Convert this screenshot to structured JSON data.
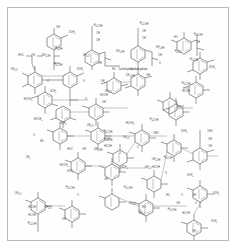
{
  "figure": {
    "kind": "chemical-structure-diagram",
    "frame_color": "#b9b9b9",
    "bond_color": "#4a4a4a",
    "background_color": "#fefefe",
    "text_color": "#3c3c3c"
  },
  "annotations": {
    "carbohydrate_label": "Carbohydrate"
  },
  "groups": {
    "methoxy": "OCH3",
    "hydroxyl": "OH",
    "hydroxymethyl": "CH2OH",
    "hydroxymethyl_left": "HOCH2",
    "hydroxymethyl_alt": "H2COH",
    "carbonyl": "HC=O",
    "aldehyde": "CHO",
    "carbinol": "HCOH",
    "methine": "CH",
    "methoxy_left": "H3CO",
    "ether_o": "O",
    "carbon": "C",
    "hydrogen_carbon": "HC"
  },
  "ring_count": 25,
  "labels": [
    {
      "id": 1,
      "text": "OH",
      "x": 50,
      "y": 20
    },
    {
      "id": 2,
      "text": "OCH3",
      "x": 64,
      "y": 25
    },
    {
      "id": 3,
      "text": "CH2OH",
      "x": 50,
      "y": 41
    },
    {
      "id": 4,
      "text": "HOC",
      "x": 13,
      "y": 48
    },
    {
      "id": 5,
      "text": "CH",
      "x": 25,
      "y": 48
    },
    {
      "id": 6,
      "text": "CH2OH",
      "x": 38,
      "y": 48
    },
    {
      "id": 7,
      "text": "H2COH",
      "x": 50,
      "y": 57
    },
    {
      "id": 8,
      "text": "CH3O",
      "x": 6,
      "y": 62
    },
    {
      "id": 9,
      "text": "OCH3",
      "x": 72,
      "y": 62
    },
    {
      "id": 10,
      "text": "O",
      "x": 40,
      "y": 74
    },
    {
      "id": 11,
      "text": "O",
      "x": 76,
      "y": 74
    },
    {
      "id": 12,
      "text": "CH2",
      "x": 95,
      "y": 74
    },
    {
      "id": 13,
      "text": "OCH3",
      "x": 45,
      "y": 84
    },
    {
      "id": 14,
      "text": "HOCH2",
      "x": 20,
      "y": 92
    },
    {
      "id": 15,
      "text": "HCOH",
      "x": 96,
      "y": 88
    },
    {
      "id": 16,
      "text": "O",
      "x": 78,
      "y": 92
    },
    {
      "id": 17,
      "text": "OH",
      "x": 96,
      "y": 95
    },
    {
      "id": 18,
      "text": "H2COH",
      "x": 90,
      "y": 18
    },
    {
      "id": 19,
      "text": "CH",
      "x": 90,
      "y": 26
    },
    {
      "id": 20,
      "text": "CH",
      "x": 90,
      "y": 33
    },
    {
      "id": 21,
      "text": "CH3O",
      "x": 78,
      "y": 48
    },
    {
      "id": 22,
      "text": "OH",
      "x": 92,
      "y": 56
    },
    {
      "id": 23,
      "text": "Carbohydrate",
      "x": 118,
      "y": 62
    },
    {
      "id": 24,
      "text": "HC",
      "x": 106,
      "y": 62
    },
    {
      "id": 25,
      "text": "CH2OH",
      "x": 112,
      "y": 44
    },
    {
      "id": 26,
      "text": "H2COH",
      "x": 136,
      "y": 16
    },
    {
      "id": 27,
      "text": "CH",
      "x": 136,
      "y": 24
    },
    {
      "id": 28,
      "text": "CH",
      "x": 136,
      "y": 31
    },
    {
      "id": 29,
      "text": "CH2OH",
      "x": 152,
      "y": 40
    },
    {
      "id": 30,
      "text": "CH",
      "x": 152,
      "y": 48
    },
    {
      "id": 31,
      "text": "O",
      "x": 152,
      "y": 56
    },
    {
      "id": 32,
      "text": "HO",
      "x": 168,
      "y": 30
    },
    {
      "id": 33,
      "text": "H2COH",
      "x": 190,
      "y": 27
    },
    {
      "id": 34,
      "text": "CH",
      "x": 190,
      "y": 35
    },
    {
      "id": 35,
      "text": "H3CO",
      "x": 170,
      "y": 44
    },
    {
      "id": 36,
      "text": "H2COH",
      "x": 186,
      "y": 52
    },
    {
      "id": 37,
      "text": "OCH3",
      "x": 204,
      "y": 60
    },
    {
      "id": 38,
      "text": "CH3O",
      "x": 100,
      "y": 84
    },
    {
      "id": 39,
      "text": "CH2OH",
      "x": 122,
      "y": 68
    },
    {
      "id": 40,
      "text": "OH",
      "x": 140,
      "y": 68
    },
    {
      "id": 41,
      "text": "H2COH",
      "x": 178,
      "y": 76
    },
    {
      "id": 42,
      "text": "HCOH",
      "x": 178,
      "y": 84
    },
    {
      "id": 43,
      "text": "HOCH2",
      "x": 30,
      "y": 112
    },
    {
      "id": 44,
      "text": "OCH3",
      "x": 55,
      "y": 116
    },
    {
      "id": 45,
      "text": "CH3O",
      "x": 82,
      "y": 118
    },
    {
      "id": 46,
      "text": "O",
      "x": 26,
      "y": 128
    },
    {
      "id": 47,
      "text": "HC",
      "x": 34,
      "y": 134
    },
    {
      "id": 48,
      "text": "H2COH",
      "x": 100,
      "y": 124
    },
    {
      "id": 49,
      "text": "CH",
      "x": 100,
      "y": 132
    },
    {
      "id": 50,
      "text": "HOCH2",
      "x": 122,
      "y": 116
    },
    {
      "id": 51,
      "text": "CH3O",
      "x": 118,
      "y": 130
    },
    {
      "id": 52,
      "text": "O",
      "x": 130,
      "y": 140
    },
    {
      "id": 53,
      "text": "H2COH",
      "x": 146,
      "y": 112
    },
    {
      "id": 54,
      "text": "CHO",
      "x": 148,
      "y": 126
    },
    {
      "id": 55,
      "text": "OCH3",
      "x": 176,
      "y": 124
    },
    {
      "id": 56,
      "text": "CHO",
      "x": 202,
      "y": 124
    },
    {
      "id": 57,
      "text": "CH",
      "x": 202,
      "y": 132
    },
    {
      "id": 58,
      "text": "CH",
      "x": 202,
      "y": 139
    },
    {
      "id": 59,
      "text": "HOC",
      "x": 62,
      "y": 142
    },
    {
      "id": 60,
      "text": "CH",
      "x": 76,
      "y": 142
    },
    {
      "id": 61,
      "text": "CH2OH",
      "x": 90,
      "y": 142
    },
    {
      "id": 62,
      "text": "H2COH",
      "x": 100,
      "y": 132
    },
    {
      "id": 63,
      "text": "HCOH",
      "x": 100,
      "y": 139
    },
    {
      "id": 64,
      "text": "O",
      "x": 112,
      "y": 146
    },
    {
      "id": 65,
      "text": "OCH3",
      "x": 116,
      "y": 160
    },
    {
      "id": 66,
      "text": "OH",
      "x": 98,
      "y": 172
    },
    {
      "id": 67,
      "text": "CH2",
      "x": 20,
      "y": 150
    },
    {
      "id": 68,
      "text": "HOCH2",
      "x": 56,
      "y": 158
    },
    {
      "id": 69,
      "text": "OCH3",
      "x": 62,
      "y": 164
    },
    {
      "id": 70,
      "text": "CH2OH",
      "x": 148,
      "y": 152
    },
    {
      "id": 71,
      "text": "HCOH",
      "x": 148,
      "y": 160
    },
    {
      "id": 72,
      "text": "O",
      "x": 158,
      "y": 166
    },
    {
      "id": 73,
      "text": "OCH3",
      "x": 182,
      "y": 168
    },
    {
      "id": 74,
      "text": "H2COH",
      "x": 160,
      "y": 150
    },
    {
      "id": 75,
      "text": "CH3O",
      "x": 140,
      "y": 160
    },
    {
      "id": 76,
      "text": "CH3O",
      "x": 10,
      "y": 186
    },
    {
      "id": 77,
      "text": "H2COH",
      "x": 62,
      "y": 180
    },
    {
      "id": 78,
      "text": "O",
      "x": 70,
      "y": 188
    },
    {
      "id": 79,
      "text": "CH3O",
      "x": 40,
      "y": 200
    },
    {
      "id": 80,
      "text": "OH",
      "x": 56,
      "y": 212
    },
    {
      "id": 81,
      "text": "HCOH",
      "x": 24,
      "y": 200
    },
    {
      "id": 82,
      "text": "HCOH",
      "x": 24,
      "y": 208
    },
    {
      "id": 83,
      "text": "H2COH",
      "x": 24,
      "y": 216
    },
    {
      "id": 84,
      "text": "H2COH",
      "x": 120,
      "y": 180
    },
    {
      "id": 85,
      "text": "CH3O",
      "x": 124,
      "y": 196
    },
    {
      "id": 86,
      "text": "O",
      "x": 132,
      "y": 204
    },
    {
      "id": 87,
      "text": "CH3O",
      "x": 134,
      "y": 206
    },
    {
      "id": 88,
      "text": "HO",
      "x": 136,
      "y": 200
    },
    {
      "id": 89,
      "text": "HC",
      "x": 160,
      "y": 188
    },
    {
      "id": 90,
      "text": "O",
      "x": 174,
      "y": 188
    },
    {
      "id": 91,
      "text": "CH",
      "x": 186,
      "y": 188
    },
    {
      "id": 92,
      "text": "OCH3",
      "x": 208,
      "y": 186
    },
    {
      "id": 93,
      "text": "CH",
      "x": 170,
      "y": 196
    },
    {
      "id": 94,
      "text": "O",
      "x": 188,
      "y": 196
    },
    {
      "id": 95,
      "text": "H2COH",
      "x": 164,
      "y": 202
    },
    {
      "id": 96,
      "text": "HCOH",
      "x": 178,
      "y": 206
    },
    {
      "id": 97,
      "text": "OCH3",
      "x": 206,
      "y": 214
    },
    {
      "id": 98,
      "text": "OH",
      "x": 186,
      "y": 224
    }
  ]
}
